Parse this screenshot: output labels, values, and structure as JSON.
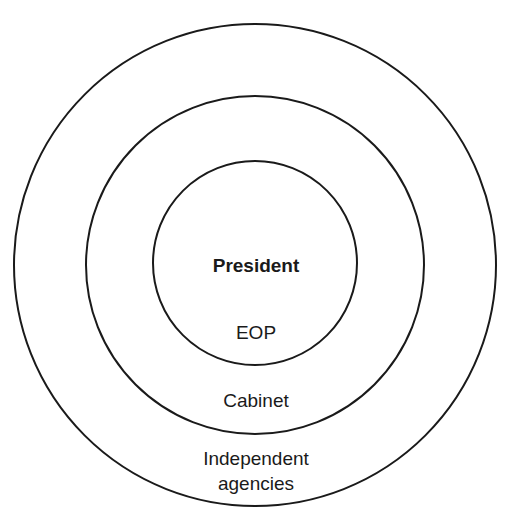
{
  "diagram": {
    "type": "concentric-circles",
    "rings": [
      {
        "name": "outer",
        "label_lines": [
          "Independent",
          "agencies"
        ]
      },
      {
        "name": "middle",
        "label_lines": [
          "Cabinet"
        ]
      },
      {
        "name": "inner",
        "label_lines": [
          "EOP"
        ]
      }
    ],
    "center_label": "President",
    "stroke_color": "#1a1a1a"
  }
}
